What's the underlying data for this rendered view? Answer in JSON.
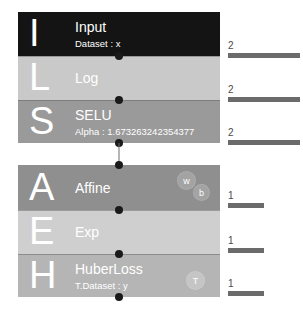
{
  "diagram": {
    "groups": [
      {
        "name": "forward-group",
        "layers": [
          {
            "initial": "I",
            "title": "Input",
            "subtitle": "Dataset : x",
            "color": "#141414",
            "badges": []
          },
          {
            "initial": "L",
            "title": "Log",
            "subtitle": "",
            "color": "#c9c9c9",
            "badges": []
          },
          {
            "initial": "S",
            "title": "SELU",
            "subtitle": "Alpha : 1.673263242354377",
            "color": "#9a9a9a",
            "badges": []
          }
        ]
      },
      {
        "name": "loss-group",
        "layers": [
          {
            "initial": "A",
            "title": "Affine",
            "subtitle": "",
            "color": "#8f8f8f",
            "badges": [
              "w",
              "b"
            ]
          },
          {
            "initial": "E",
            "title": "Exp",
            "subtitle": "",
            "color": "#cfcfcf",
            "badges": []
          },
          {
            "initial": "H",
            "title": "HuberLoss",
            "subtitle": "T.Dataset : y",
            "color": "#b5b5b5",
            "badges": [
              "T"
            ]
          }
        ]
      }
    ],
    "output_bars": [
      {
        "value": "2",
        "width": "wide",
        "for": "Input"
      },
      {
        "value": "2",
        "width": "wide",
        "for": "Log"
      },
      {
        "value": "2",
        "width": "wide",
        "for": "SELU"
      },
      {
        "value": "1",
        "width": "narrow",
        "for": "Affine"
      },
      {
        "value": "1",
        "width": "narrow",
        "for": "Exp"
      },
      {
        "value": "1",
        "width": "narrow",
        "for": "HuberLoss"
      }
    ],
    "accent_colors": {
      "dot": "#1a1a1a",
      "link": "#6f6f6f",
      "bar": "#6b6b6b",
      "bar_label": "#4a4a4a",
      "background": "#ffffff"
    }
  }
}
